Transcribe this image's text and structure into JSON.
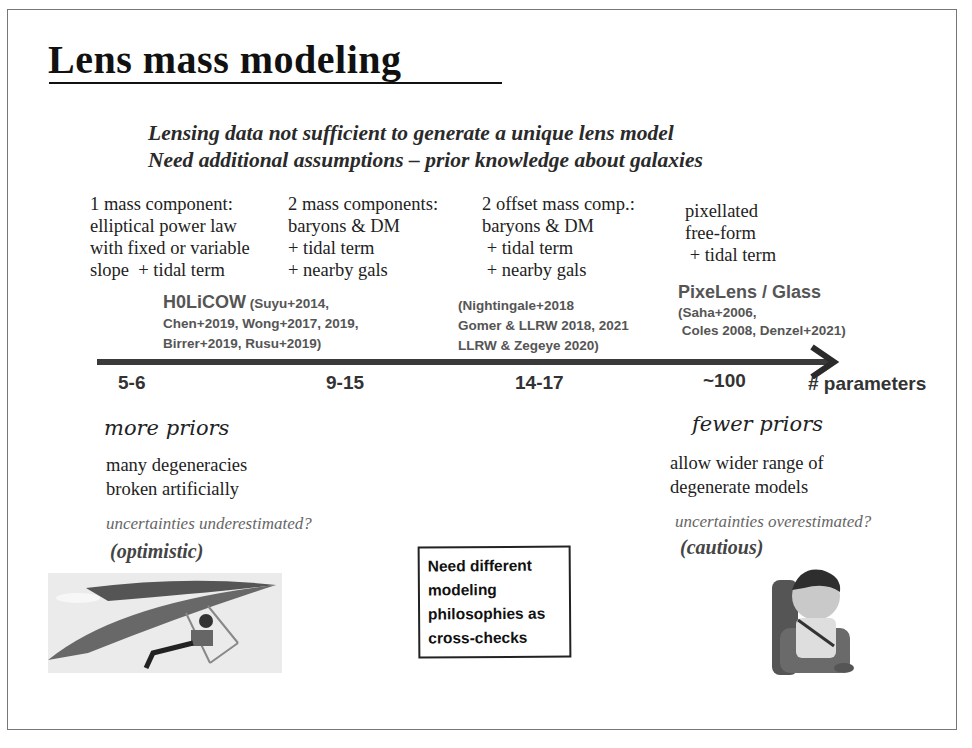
{
  "slide": {
    "title": "Lens mass modeling",
    "subtitle_lines": [
      "Lensing data not sufficient to generate a unique lens model",
      "Need additional assumptions – prior knowledge about galaxies"
    ],
    "columns": [
      {
        "description": "1 mass component:\nelliptical power law\nwith fixed or variable\nslope  + tidal term",
        "ref_name": "H0LiCOW",
        "references": " (Suyu+2014,\nChen+2019, Wong+2017, 2019,\nBirrer+2019, Rusu+2019)",
        "parameters": "5-6"
      },
      {
        "description": "2 mass components:\nbaryons & DM\n+ tidal term\n+ nearby gals",
        "ref_name": "",
        "references": "",
        "parameters": "9-15"
      },
      {
        "description": "2 offset mass comp.:\nbaryons & DM\n + tidal term\n + nearby gals",
        "ref_name": "",
        "references": "(Nightingale+2018\nGomer & LLRW 2018, 2021\nLLRW & Zegeye 2020)",
        "parameters": "14-17"
      },
      {
        "description": "pixellated\nfree-form\n + tidal term",
        "ref_name": "PixeLens / Glass",
        "references": "(Saha+2006,\n Coles 2008, Denzel+2021)",
        "parameters": "~100"
      }
    ],
    "axis_label": "# parameters",
    "left": {
      "heading": "more priors",
      "body": "many degeneracies\nbroken artificially",
      "uncertainty": "uncertainties underestimated?",
      "attitude": "(optimistic)",
      "image": "hang-glider-illustration"
    },
    "right": {
      "heading": "fewer priors",
      "body": "allow wider range of\ndegenerate models",
      "uncertainty": "uncertainties overestimated?",
      "attitude": "(cautious)",
      "image": "child-car-seat-illustration"
    },
    "callout_lines": [
      "Need different",
      "modeling",
      "philosophies as",
      "cross-checks"
    ],
    "colors": {
      "arrow": "#3a3a3a",
      "text": "#222222",
      "reference": "#555555"
    }
  }
}
